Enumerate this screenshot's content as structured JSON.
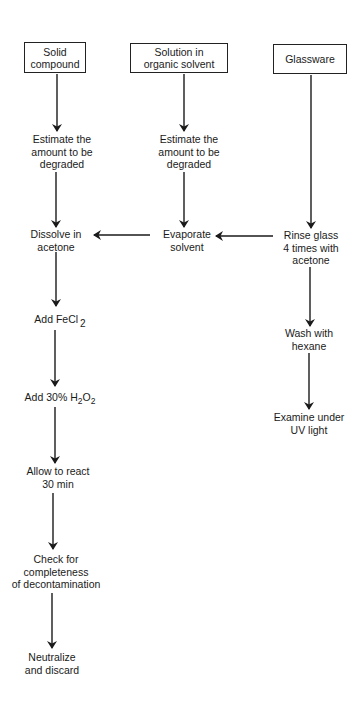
{
  "diagram": {
    "type": "flowchart",
    "title": "",
    "sources": [
      {
        "id": "solid",
        "label_lines": [
          "Solid",
          "compound"
        ]
      },
      {
        "id": "solution",
        "label_lines": [
          "Solution in",
          "organic solvent"
        ]
      },
      {
        "id": "glassware",
        "label_lines": [
          "Glassware"
        ]
      }
    ],
    "steps": {
      "solid_estimate": [
        "Estimate the",
        "amount to be",
        "degraded"
      ],
      "solution_estimate": [
        "Estimate the",
        "amount to be",
        "degraded"
      ],
      "dissolve": [
        "Dissolve in",
        "acetone"
      ],
      "evaporate": [
        "Evaporate",
        "solvent"
      ],
      "rinse": [
        "Rinse glass",
        "4 times with",
        "acetone"
      ],
      "add_fecl2": {
        "text": "Add FeCl",
        "subscript": "2"
      },
      "add_h2o2": {
        "prefix": "Add 30% H",
        "sub1": "2",
        "mid": "O",
        "sub2": "2"
      },
      "react": [
        "Allow to react",
        "30 min"
      ],
      "check": [
        "Check for",
        "completeness",
        "of decontamination"
      ],
      "neutralize": [
        "Neutralize",
        "and discard"
      ],
      "wash": [
        "Wash with",
        "hexane"
      ],
      "examine": [
        "Examine under",
        "UV light"
      ]
    },
    "edges": [
      [
        "Solid compound",
        "Estimate the amount to be degraded (left)"
      ],
      [
        "Estimate the amount to be degraded (left)",
        "Dissolve in acetone"
      ],
      [
        "Solution in organic solvent",
        "Estimate the amount to be degraded (middle)"
      ],
      [
        "Estimate the amount to be degraded (middle)",
        "Evaporate solvent"
      ],
      [
        "Glassware",
        "Rinse glass 4 times with acetone"
      ],
      [
        "Rinse glass 4 times with acetone",
        "Evaporate solvent"
      ],
      [
        "Evaporate solvent",
        "Dissolve in acetone"
      ],
      [
        "Dissolve in acetone",
        "Add FeCl2"
      ],
      [
        "Add FeCl2",
        "Add 30% H2O2"
      ],
      [
        "Add 30% H2O2",
        "Allow to react 30 min"
      ],
      [
        "Allow to react 30 min",
        "Check for completeness of decontamination"
      ],
      [
        "Check for completeness of decontamination",
        "Neutralize and discard"
      ],
      [
        "Rinse glass 4 times with acetone",
        "Wash with hexane"
      ],
      [
        "Wash with hexane",
        "Examine under UV light"
      ]
    ],
    "colors": {
      "line": "#1a1a1a",
      "background": "#ffffff"
    }
  }
}
